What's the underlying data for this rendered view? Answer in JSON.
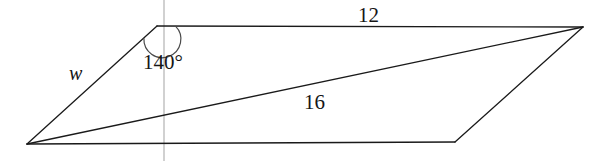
{
  "figure": {
    "kind": "geometry-diagram",
    "canvas": {
      "width": 601,
      "height": 161,
      "background": "#ffffff"
    },
    "stroke": {
      "color": "#1a1a1a",
      "width": 1.2
    },
    "reference_line": {
      "color": "#b9b9b9",
      "width": 1.2,
      "x": 164,
      "y_top": 0,
      "y_bottom": 161
    },
    "vertices": {
      "top_left": {
        "x": 157,
        "y": 26
      },
      "top_right": {
        "x": 583,
        "y": 27
      },
      "bottom_right": {
        "x": 455,
        "y": 142
      },
      "bottom_left": {
        "x": 27,
        "y": 144
      }
    },
    "edges": [
      {
        "name": "top-edge",
        "from": "top_left",
        "to": "top_right",
        "label": "12"
      },
      {
        "name": "right-edge",
        "from": "top_right",
        "to": "bottom_right",
        "label": ""
      },
      {
        "name": "bottom-edge",
        "from": "bottom_right",
        "to": "bottom_left",
        "label": ""
      },
      {
        "name": "left-edge",
        "from": "bottom_left",
        "to": "top_left",
        "label": "w"
      }
    ],
    "diagonal": {
      "name": "diagonal",
      "from": "bottom_left",
      "to": "top_right",
      "label": "16"
    },
    "angle_arc": {
      "at": "top_left",
      "radius": 17,
      "value": "140°"
    },
    "labels": {
      "side_12": "12",
      "diagonal_16": "16",
      "angle_140": "140°",
      "side_w": "w"
    }
  }
}
